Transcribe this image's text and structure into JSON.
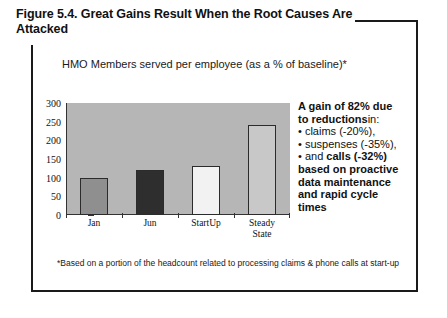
{
  "figure": {
    "title": "Figure 5.4.  Great Gains Result When the Root Causes Are Attacked",
    "subtitle": "HMO Members served per employee (as a % of baseline)*",
    "footnote": "*Based on a portion of the headcount related to processing claims &  phone calls at start-up"
  },
  "callout": {
    "line1_bold": "A gain of 82% due",
    "line2_bold": "to reductions",
    "line2_rest": "in:",
    "line3": "• claims (-20%),",
    "line4": "• suspenses (-35%),",
    "line5_prefix": "• and ",
    "line5_bold": "calls (-32%)",
    "line6": "based on proactive",
    "line7": "data maintenance",
    "line8": "and rapid cycle",
    "line9": "times"
  },
  "colors": {
    "plot_background": "#b6b6b6",
    "bar_jan": "#8f8f8f",
    "bar_jun": "#2e2e2e",
    "bar_startup": "#f2f2f2",
    "bar_steady": "#c8c8c8",
    "axis": "#333333",
    "text": "#111111"
  },
  "chart_data": {
    "type": "bar",
    "title": "HMO Members served per employee (as a % of baseline)*",
    "xlabel": "",
    "ylabel": "",
    "ylim": [
      0,
      300
    ],
    "yticks": [
      0,
      50,
      100,
      150,
      200,
      250,
      300
    ],
    "grid": false,
    "legend": "none",
    "categories": [
      "Jan",
      "Jun",
      "StartUp",
      "Steady State"
    ],
    "category_lines": [
      [
        "Jan"
      ],
      [
        "Jun"
      ],
      [
        "StartUp"
      ],
      [
        "Steady",
        "State"
      ]
    ],
    "values": [
      100,
      120,
      130,
      242
    ],
    "bar_colors": [
      "#8f8f8f",
      "#2e2e2e",
      "#f2f2f2",
      "#c8c8c8"
    ]
  }
}
